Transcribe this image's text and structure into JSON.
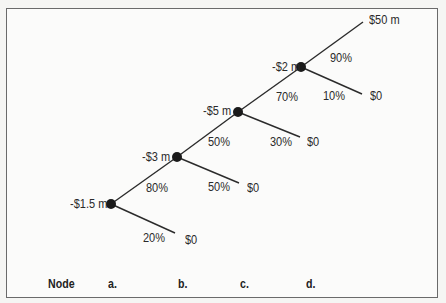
{
  "diagram": {
    "type": "decision-tree",
    "nodes": [
      {
        "id": "a",
        "cost": "-$1.5 m",
        "success_prob": "80%",
        "fail_prob": "20%",
        "fail_value": "$0"
      },
      {
        "id": "b",
        "cost": "-$3 m",
        "success_prob": "50%",
        "fail_prob": "50%",
        "fail_value": "$0"
      },
      {
        "id": "c",
        "cost": "-$5 m",
        "success_prob": "70%",
        "fail_prob": "30%",
        "fail_value": "$0"
      },
      {
        "id": "d",
        "cost": "-$2 m",
        "success_prob": "90%",
        "fail_prob": "10%",
        "fail_value": "$0",
        "success_value": "$50 m"
      }
    ],
    "footer": {
      "label": "Node",
      "items": [
        "a.",
        "b.",
        "c.",
        "d."
      ]
    }
  }
}
